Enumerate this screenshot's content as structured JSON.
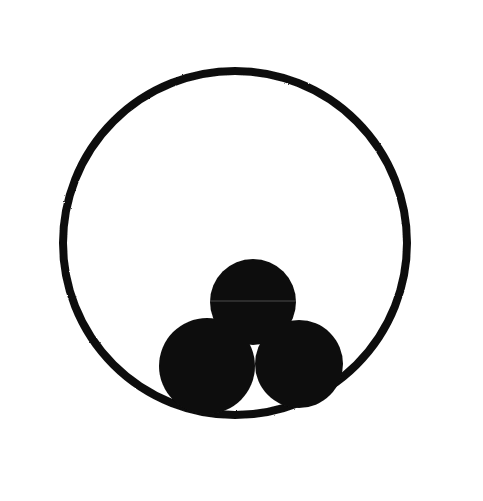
{
  "image": {
    "kind": "emblem-illustration",
    "width": 483,
    "height": 501,
    "background_color": "#ffffff",
    "ink_color": "#111111",
    "description": "Abstract black-and-white emblem: three overlapping filled discs clustered in a triangle inside a large thin circular ring, enclosed in a thin rectangular frame."
  },
  "frame": {
    "name": "rectangular-border",
    "stroke_color": "#4a4a4a",
    "stroke_width": 1,
    "left": 13,
    "top": 12,
    "width": 453,
    "height": 465
  },
  "shapes": {
    "ring": {
      "label": "large-circle-outline",
      "cx": 235,
      "cy": 243,
      "r": 172,
      "stroke_color": "#111111",
      "stroke_width": 8,
      "fill": "none"
    },
    "discs": [
      {
        "label": "top-disc",
        "cx": 253,
        "cy": 302,
        "r": 43,
        "fill": "#111111"
      },
      {
        "label": "left-disc",
        "cx": 207,
        "cy": 366,
        "r": 48,
        "fill": "#111111"
      },
      {
        "label": "right-disc",
        "cx": 299,
        "cy": 364,
        "r": 44,
        "fill": "#111111"
      }
    ]
  },
  "palette": {
    "ink": "#111111",
    "paper": "#ffffff",
    "frame_line": "#4a4a4a"
  }
}
